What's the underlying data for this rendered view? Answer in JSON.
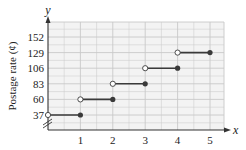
{
  "chart_data": {
    "type": "line",
    "subtype": "step",
    "title": "",
    "xlabel": "x",
    "ylabel": "Postage rate (¢)",
    "y_axis_letter": "y",
    "x_ticks": [
      "1",
      "2",
      "3",
      "4",
      "5"
    ],
    "y_ticks": [
      "37",
      "60",
      "83",
      "106",
      "129",
      "152"
    ],
    "xlim": [
      0,
      5.4
    ],
    "ylim": [
      37,
      165
    ],
    "grid": true,
    "axis_break": "y",
    "segments": [
      {
        "x_start": 0,
        "x_end": 1,
        "y": 37,
        "start_open": true,
        "end_closed": true
      },
      {
        "x_start": 1,
        "x_end": 2,
        "y": 60,
        "start_open": true,
        "end_closed": true
      },
      {
        "x_start": 2,
        "x_end": 3,
        "y": 83,
        "start_open": true,
        "end_closed": true
      },
      {
        "x_start": 3,
        "x_end": 4,
        "y": 106,
        "start_open": true,
        "end_closed": true
      },
      {
        "x_start": 4,
        "x_end": 5,
        "y": 129,
        "start_open": true,
        "end_closed": true
      }
    ],
    "colors": {
      "line": "#3a3a3a",
      "grid": "#c8c8c8",
      "background": "#f4f4f4"
    }
  }
}
